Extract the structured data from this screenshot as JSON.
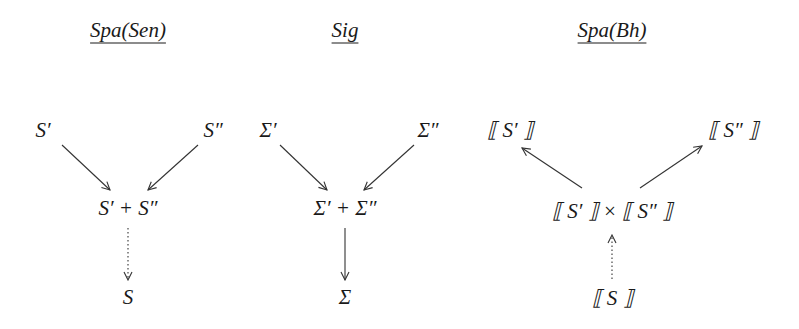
{
  "diagrams": [
    {
      "title": "Spa(Sen)",
      "nodes": {
        "left": "S′",
        "right": "S″",
        "middle": "S′ + S″",
        "bottom": "S"
      },
      "edges": [
        {
          "from": "left",
          "to": "middle",
          "style": "solid"
        },
        {
          "from": "right",
          "to": "middle",
          "style": "solid"
        },
        {
          "from": "middle",
          "to": "bottom",
          "style": "dotted"
        }
      ]
    },
    {
      "title": "Sig",
      "nodes": {
        "left": "Σ′",
        "right": "Σ″",
        "middle": "Σ′ + Σ″",
        "bottom": "Σ"
      },
      "edges": [
        {
          "from": "left",
          "to": "middle",
          "style": "solid"
        },
        {
          "from": "right",
          "to": "middle",
          "style": "solid"
        },
        {
          "from": "middle",
          "to": "bottom",
          "style": "solid"
        }
      ]
    },
    {
      "title": "Spa(Bh)",
      "nodes": {
        "left": "⟦ S′ ⟧",
        "right": "⟦ S″ ⟧",
        "middle": "⟦ S′ ⟧ × ⟦ S″ ⟧",
        "bottom": "⟦ S ⟧"
      },
      "edges": [
        {
          "from": "middle",
          "to": "left",
          "style": "solid"
        },
        {
          "from": "middle",
          "to": "right",
          "style": "solid"
        },
        {
          "from": "bottom",
          "to": "middle",
          "style": "dotted"
        }
      ]
    }
  ]
}
